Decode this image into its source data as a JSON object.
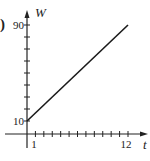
{
  "panel_label": ")",
  "chart_data": {
    "type": "line",
    "title": "",
    "xlabel": "t",
    "ylabel": "W",
    "x_tick_labels": [
      "1",
      "12"
    ],
    "y_tick_labels": [
      "10",
      "90"
    ],
    "x_ticks": [
      1,
      2,
      3,
      4,
      5,
      6,
      7,
      8,
      9,
      10,
      11,
      12
    ],
    "y_ticks": [
      10,
      20,
      30,
      40,
      50,
      60,
      70,
      80,
      90
    ],
    "xlim": [
      0,
      13
    ],
    "ylim": [
      0,
      95
    ],
    "grid": false,
    "legend": null,
    "series": [
      {
        "name": "W(t)",
        "x": [
          0,
          12
        ],
        "y": [
          10,
          90
        ],
        "color": "#1a1a1a"
      }
    ]
  }
}
